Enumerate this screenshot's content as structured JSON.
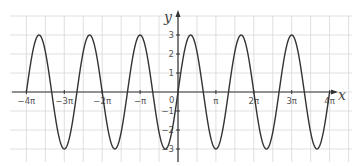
{
  "chart_data": {
    "type": "line",
    "title": "",
    "function": "y = 3 sin(3x/2)",
    "xlabel": "x",
    "ylabel": "y",
    "xlim_pi": [
      -4,
      4
    ],
    "ylim": [
      -3,
      3
    ],
    "grid": true,
    "x_ticks": [
      {
        "value_pi": -4,
        "label": "−4π"
      },
      {
        "value_pi": -3,
        "label": "−3π"
      },
      {
        "value_pi": -2,
        "label": "−2π"
      },
      {
        "value_pi": -1,
        "label": "−π"
      },
      {
        "value_pi": 1,
        "label": "π"
      },
      {
        "value_pi": 2,
        "label": "2π"
      },
      {
        "value_pi": 3,
        "label": "3π"
      },
      {
        "value_pi": 4,
        "label": "4π"
      }
    ],
    "origin_label": "0",
    "y_ticks": [
      {
        "value": 3,
        "label": "3"
      },
      {
        "value": 2,
        "label": "2"
      },
      {
        "value": 1,
        "label": "1"
      },
      {
        "value": -1,
        "label": "−1"
      },
      {
        "value": -2,
        "label": "−2"
      },
      {
        "value": -3,
        "label": "−3"
      }
    ],
    "series": [
      {
        "name": "curve",
        "amplitude": 3,
        "angular_frequency": 1.5,
        "period_pi": 1.3333,
        "x_range_pi": [
          -4,
          4
        ],
        "color": "#333333"
      }
    ]
  },
  "layout": {
    "origin_px": [
      178,
      92
    ],
    "px_per_pi": 37.9,
    "px_per_unit_y": 19,
    "grid_color": "#d8d8d8",
    "axis_color": "#333333"
  }
}
